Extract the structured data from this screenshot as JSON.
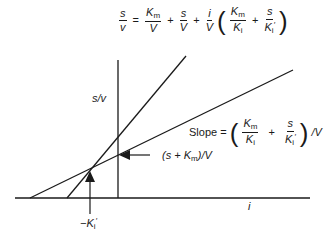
{
  "equation": {
    "lhs_num": "s",
    "lhs_den": "v",
    "eq": "=",
    "t1_num": "K",
    "t1_num_sub": "m",
    "t1_den": "V",
    "plus": "+",
    "t2_num": "s",
    "t2_den": "V",
    "t3_num": "i",
    "t3_den": "V",
    "p1_num": "K",
    "p1_num_sub": "m",
    "p1_den": "K",
    "p1_den_sub": "i",
    "p2_num": "s",
    "p2_den": "K",
    "p2_den_sub": "i",
    "p2_den_prime": "′",
    "lparen": "(",
    "rparen": ")"
  },
  "axes": {
    "y_label": "s/v",
    "x_label": "i"
  },
  "annotations": {
    "slope_prefix": "Slope =",
    "slope_suffix": "/V",
    "intercept_label_pre": "(s + K",
    "intercept_label_sub": "m",
    "intercept_label_post": ")/V",
    "intersect_label_minus": "−K",
    "intersect_label_sub": "i",
    "intersect_label_prime": "′"
  },
  "geometry": {
    "x_axis": {
      "x1": 15,
      "y1": 198,
      "x2": 310,
      "y2": 198
    },
    "vertical_line": {
      "x": 118,
      "y1": 60,
      "y2": 198
    },
    "steep_line": {
      "x1": 67,
      "y1": 198,
      "x2": 186,
      "y2": 56
    },
    "shallow_line": {
      "x1": 30,
      "y1": 198,
      "x2": 293,
      "y2": 70
    },
    "intersection": {
      "x": 90,
      "y": 170
    }
  },
  "colors": {
    "line": "#1a1a1a",
    "background": "#ffffff"
  }
}
